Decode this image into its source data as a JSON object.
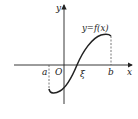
{
  "diagram": {
    "title": "",
    "axes": {
      "x_label": "x",
      "y_label": "y",
      "origin_label": "O"
    },
    "curve_label": "y=f(x)",
    "points": {
      "a": "a",
      "b": "b",
      "xi": "ξ"
    },
    "colors": {
      "stroke": "#222222",
      "dash": "#555555",
      "background": "#ffffff"
    }
  }
}
